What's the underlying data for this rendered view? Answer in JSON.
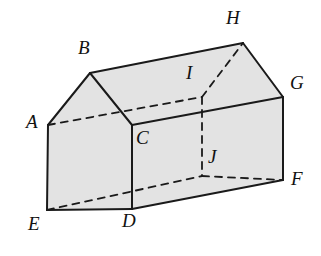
{
  "figure": {
    "kind": "3d-solid-diagram",
    "canvas": {
      "width": 321,
      "height": 256
    },
    "style": {
      "background_color": "#ffffff",
      "face_fill_color": "#e3e3e3",
      "visible_edge_color": "#1a1a1a",
      "hidden_edge_color": "#1a1a1a",
      "visible_edge_width": 2.0,
      "hidden_edge_width": 1.8,
      "hidden_edge_dash": "7,6",
      "label_color": "#111111",
      "label_font_size": 19,
      "label_font_style": "italic"
    },
    "vertices": [
      {
        "name": "A",
        "x": 48,
        "y": 125,
        "label_x": 26,
        "label_y": 112,
        "hidden": false
      },
      {
        "name": "B",
        "x": 90,
        "y": 73,
        "label_x": 78,
        "label_y": 38,
        "hidden": false
      },
      {
        "name": "C",
        "x": 132,
        "y": 125,
        "label_x": 136,
        "label_y": 128,
        "hidden": false
      },
      {
        "name": "D",
        "x": 132,
        "y": 209,
        "label_x": 122,
        "label_y": 211,
        "hidden": false
      },
      {
        "name": "E",
        "x": 47,
        "y": 210,
        "label_x": 28,
        "label_y": 214,
        "hidden": false
      },
      {
        "name": "F",
        "x": 283,
        "y": 180,
        "label_x": 291,
        "label_y": 169,
        "hidden": false
      },
      {
        "name": "G",
        "x": 283,
        "y": 97,
        "label_x": 290,
        "label_y": 73,
        "hidden": false
      },
      {
        "name": "H",
        "x": 243,
        "y": 43,
        "label_x": 226,
        "label_y": 8,
        "hidden": false
      },
      {
        "name": "I",
        "x": 202,
        "y": 97,
        "label_x": 186,
        "label_y": 63,
        "hidden": true
      },
      {
        "name": "J",
        "x": 202,
        "y": 176,
        "label_x": 208,
        "label_y": 147,
        "hidden": true
      }
    ],
    "faces": [
      {
        "name": "left-gable-face",
        "vertices": [
          "A",
          "B",
          "C",
          "D",
          "E"
        ]
      },
      {
        "name": "front-wall-face",
        "vertices": [
          "C",
          "G",
          "F",
          "D"
        ]
      },
      {
        "name": "front-roof-face",
        "vertices": [
          "B",
          "H",
          "G",
          "C"
        ]
      },
      {
        "name": "right-gable-face",
        "vertices": [
          "H",
          "G",
          "I"
        ]
      }
    ],
    "edges": [
      {
        "name": "A-B",
        "from": "A",
        "to": "B",
        "hidden": false
      },
      {
        "name": "B-C",
        "from": "B",
        "to": "C",
        "hidden": false
      },
      {
        "name": "A-E",
        "from": "A",
        "to": "E",
        "hidden": false
      },
      {
        "name": "E-D",
        "from": "E",
        "to": "D",
        "hidden": false
      },
      {
        "name": "D-C",
        "from": "D",
        "to": "C",
        "hidden": false
      },
      {
        "name": "B-H",
        "from": "B",
        "to": "H",
        "hidden": false
      },
      {
        "name": "C-G",
        "from": "C",
        "to": "G",
        "hidden": false
      },
      {
        "name": "D-F",
        "from": "D",
        "to": "F",
        "hidden": false
      },
      {
        "name": "H-G",
        "from": "H",
        "to": "G",
        "hidden": false
      },
      {
        "name": "G-F",
        "from": "G",
        "to": "F",
        "hidden": false
      },
      {
        "name": "A-I",
        "from": "A",
        "to": "I",
        "hidden": true
      },
      {
        "name": "I-H",
        "from": "I",
        "to": "H",
        "hidden": true
      },
      {
        "name": "I-J",
        "from": "I",
        "to": "J",
        "hidden": true
      },
      {
        "name": "E-J",
        "from": "E",
        "to": "J",
        "hidden": true
      },
      {
        "name": "J-F",
        "from": "J",
        "to": "F",
        "hidden": true
      }
    ]
  }
}
